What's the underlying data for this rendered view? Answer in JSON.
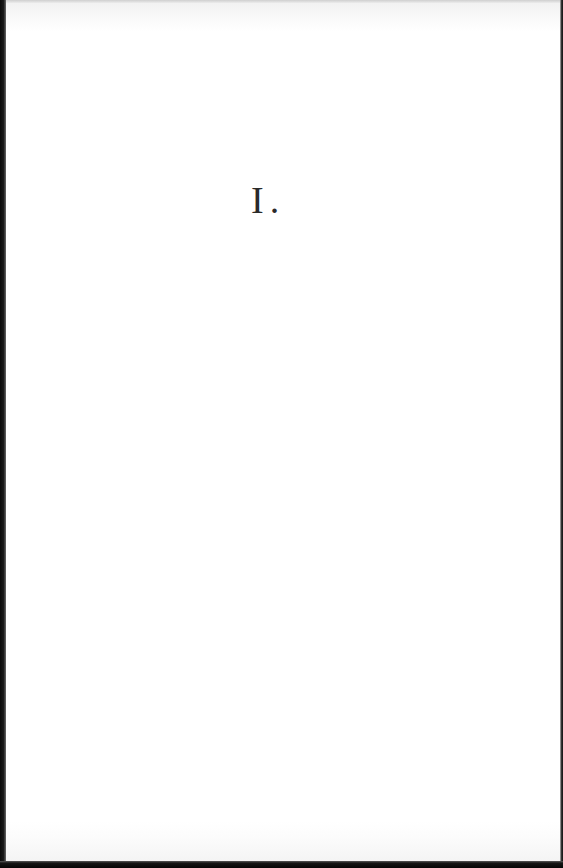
{
  "page": {
    "type": "scanned-book-page",
    "section_heading": "I."
  },
  "colors": {
    "paper": "#ffffff",
    "ink": "#2a2a2a",
    "scan_border": "#0a0a0a"
  }
}
